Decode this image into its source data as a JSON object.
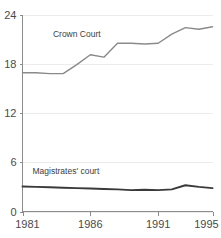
{
  "chart_data": {
    "type": "line",
    "title": "",
    "subtitle": "",
    "xlabel": "",
    "ylabel": "",
    "xlim": [
      1981,
      1995
    ],
    "ylim": [
      0,
      24
    ],
    "grid": true,
    "legend_position": "inline-labels",
    "y_ticks": [
      0,
      6,
      12,
      18,
      24
    ],
    "y_tick_labels": [
      "0",
      "6",
      "12",
      "18",
      "24"
    ],
    "x_ticks": [
      1981,
      1986,
      1991,
      1995
    ],
    "x_tick_labels": [
      "1981",
      "1986",
      "1991",
      "1995"
    ],
    "x": [
      1981,
      1982,
      1983,
      1984,
      1985,
      1986,
      1987,
      1988,
      1989,
      1990,
      1991,
      1992,
      1993,
      1994,
      1995
    ],
    "series": [
      {
        "name": "Crown Court",
        "color": "#8a8a8a",
        "width": 1.4,
        "label_x": 1985.0,
        "label_y": 21.2,
        "values": [
          16.9,
          16.9,
          16.8,
          16.8,
          17.9,
          19.1,
          18.8,
          20.5,
          20.5,
          20.4,
          20.5,
          21.6,
          22.4,
          22.2,
          22.5
        ]
      },
      {
        "name": "Magistrates' court",
        "color": "#3a3a3a",
        "width": 1.9,
        "label_x": 1984.2,
        "label_y": 4.6,
        "values": [
          3.05,
          3.0,
          2.95,
          2.9,
          2.85,
          2.8,
          2.75,
          2.7,
          2.6,
          2.65,
          2.6,
          2.7,
          3.2,
          3.0,
          2.85
        ]
      }
    ]
  }
}
